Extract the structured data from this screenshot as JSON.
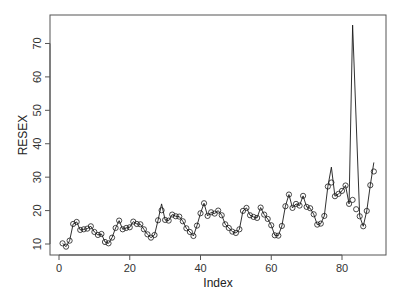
{
  "chart_data": {
    "type": "line",
    "title": "",
    "xlabel": "Index",
    "ylabel": "RESEX",
    "xlim": [
      -1.5,
      93
    ],
    "ylim": [
      6.6,
      78.5
    ],
    "x_ticks": [
      0,
      20,
      40,
      60,
      80
    ],
    "y_ticks": [
      10,
      20,
      30,
      40,
      50,
      60,
      70
    ],
    "grid": false,
    "legend": null,
    "x": [
      1,
      2,
      3,
      4,
      5,
      6,
      7,
      8,
      9,
      10,
      11,
      12,
      13,
      14,
      15,
      16,
      17,
      18,
      19,
      20,
      21,
      22,
      23,
      24,
      25,
      26,
      27,
      28,
      29,
      30,
      31,
      32,
      33,
      34,
      35,
      36,
      37,
      38,
      39,
      40,
      41,
      42,
      43,
      44,
      45,
      46,
      47,
      48,
      49,
      50,
      51,
      52,
      53,
      54,
      55,
      56,
      57,
      58,
      59,
      60,
      61,
      62,
      63,
      64,
      65,
      66,
      67,
      68,
      69,
      70,
      71,
      72,
      73,
      74,
      75,
      76,
      77,
      78,
      79,
      80,
      81,
      82,
      83,
      84,
      85,
      86,
      87,
      88,
      89
    ],
    "series": [
      {
        "name": "RESEX (line)",
        "style": "line",
        "color": "#1a1a1a",
        "values": [
          10.2,
          9.2,
          11.0,
          16.0,
          16.6,
          14.2,
          14.4,
          14.6,
          15.3,
          13.6,
          12.7,
          13.0,
          10.6,
          10.2,
          11.9,
          14.8,
          17.0,
          14.4,
          14.8,
          15.0,
          16.7,
          16.0,
          15.9,
          14.4,
          12.9,
          11.9,
          12.7,
          17.1,
          22.0,
          17.2,
          17.0,
          18.8,
          18.3,
          18.2,
          16.8,
          14.7,
          13.6,
          12.4,
          15.5,
          19.2,
          22.2,
          18.4,
          19.5,
          19.1,
          20.0,
          18.6,
          15.9,
          14.8,
          13.7,
          13.3,
          14.4,
          19.9,
          20.8,
          18.6,
          18.1,
          17.8,
          20.9,
          18.8,
          17.5,
          15.6,
          12.6,
          12.5,
          15.4,
          21.3,
          24.8,
          20.8,
          22.0,
          21.5,
          24.4,
          21.1,
          20.7,
          18.9,
          15.8,
          16.1,
          18.4,
          27.2,
          33.0,
          24.3,
          25.0,
          25.9,
          27.5,
          22.0,
          75.5,
          null,
          18.3,
          15.3,
          19.9,
          27.6,
          34.4
        ]
      },
      {
        "name": "RESEX (points)",
        "style": "points",
        "marker": "open-circle",
        "color": "#1a1a1a",
        "values": [
          10.2,
          9.2,
          11.0,
          16.0,
          16.6,
          14.2,
          14.4,
          14.6,
          15.3,
          13.6,
          12.7,
          13.0,
          10.6,
          10.2,
          11.9,
          14.8,
          17.0,
          14.4,
          14.8,
          15.0,
          16.7,
          16.0,
          15.9,
          14.4,
          12.9,
          11.9,
          12.7,
          17.1,
          20.1,
          17.2,
          17.0,
          18.8,
          18.3,
          18.2,
          16.8,
          14.7,
          13.6,
          12.4,
          15.5,
          19.2,
          22.2,
          18.4,
          19.5,
          19.1,
          20.0,
          18.6,
          15.9,
          14.8,
          13.7,
          13.3,
          14.4,
          19.9,
          20.8,
          18.6,
          18.1,
          17.8,
          20.9,
          18.8,
          17.5,
          15.6,
          12.6,
          12.5,
          15.4,
          21.3,
          24.8,
          20.8,
          22.0,
          21.5,
          24.4,
          21.1,
          20.7,
          18.9,
          15.8,
          16.1,
          18.4,
          27.2,
          28.4,
          24.3,
          25.0,
          25.9,
          27.5,
          22.0,
          23.2,
          20.4,
          18.3,
          15.3,
          19.9,
          27.6,
          31.7
        ]
      }
    ]
  },
  "axes": {
    "x_tick_labels": [
      "0",
      "20",
      "40",
      "60",
      "80"
    ],
    "y_tick_labels": [
      "10",
      "20",
      "30",
      "40",
      "50",
      "60",
      "70"
    ],
    "x_title": "Index",
    "y_title": "RESEX"
  },
  "colors": {
    "ink": "#1a1a1a",
    "frame": "#555555",
    "background": "#ffffff"
  }
}
